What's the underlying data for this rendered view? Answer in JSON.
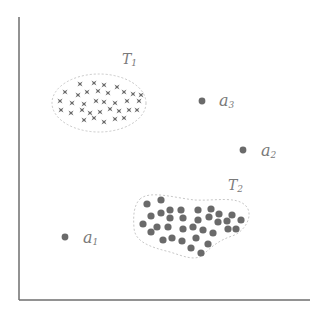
{
  "diagram": {
    "axes": {
      "color": "#6e6e6e",
      "x_axis": {
        "x1": 19,
        "x2": 310,
        "y": 300
      },
      "y_axis": {
        "x": 19,
        "y1": 17,
        "y2": 300
      }
    },
    "colors": {
      "marker": "#6a6a6a",
      "outline": "#c8c8c8",
      "label": "#7a7a7a"
    },
    "clusters": [
      {
        "id": "T1",
        "label_main": "T",
        "label_sub": "1",
        "marker": "star",
        "label_pos": [
          122,
          64
        ],
        "outline": {
          "cx": 99,
          "cy": 103,
          "rx": 47,
          "ry": 29
        },
        "points": [
          [
            80,
            84
          ],
          [
            94,
            83
          ],
          [
            104,
            85
          ],
          [
            117,
            87
          ],
          [
            65,
            92
          ],
          [
            78,
            95
          ],
          [
            87,
            92
          ],
          [
            98,
            91
          ],
          [
            108,
            93
          ],
          [
            124,
            92
          ],
          [
            133,
            94
          ],
          [
            141,
            95
          ],
          [
            60,
            101
          ],
          [
            72,
            103
          ],
          [
            84,
            104
          ],
          [
            96,
            101
          ],
          [
            104,
            102
          ],
          [
            115,
            103
          ],
          [
            127,
            101
          ],
          [
            139,
            101
          ],
          [
            61,
            110
          ],
          [
            71,
            113
          ],
          [
            82,
            110
          ],
          [
            90,
            113
          ],
          [
            100,
            112
          ],
          [
            110,
            109
          ],
          [
            119,
            111
          ],
          [
            129,
            110
          ],
          [
            137,
            110
          ],
          [
            84,
            120
          ],
          [
            94,
            118
          ],
          [
            104,
            122
          ],
          [
            115,
            119
          ],
          [
            124,
            118
          ]
        ]
      },
      {
        "id": "T2",
        "label_main": "T",
        "label_sub": "2",
        "marker": "dot",
        "label_pos": [
          228,
          190
        ],
        "outline_path": "M140,199 C150,190 175,198 195,200 C215,201 235,196 245,205 C255,214 245,232 232,236 C220,240 212,246 204,254 C196,262 183,256 170,252 C150,247 135,242 134,228 C133,215 134,205 140,199 Z",
        "points": [
          [
            147,
            204
          ],
          [
            161,
            200
          ],
          [
            151,
            216
          ],
          [
            161,
            213
          ],
          [
            170,
            210
          ],
          [
            181,
            210
          ],
          [
            170,
            218
          ],
          [
            183,
            218
          ],
          [
            143,
            224
          ],
          [
            157,
            227
          ],
          [
            168,
            227
          ],
          [
            151,
            232
          ],
          [
            183,
            229
          ],
          [
            193,
            227
          ],
          [
            198,
            210
          ],
          [
            198,
            220
          ],
          [
            211,
            209
          ],
          [
            209,
            217
          ],
          [
            219,
            214
          ],
          [
            227,
            221
          ],
          [
            232,
            215
          ],
          [
            241,
            220
          ],
          [
            218,
            222
          ],
          [
            203,
            230
          ],
          [
            213,
            233
          ],
          [
            228,
            229
          ],
          [
            236,
            229
          ],
          [
            163,
            240
          ],
          [
            172,
            238
          ],
          [
            182,
            241
          ],
          [
            196,
            238
          ],
          [
            191,
            248
          ],
          [
            201,
            253
          ],
          [
            208,
            244
          ]
        ]
      }
    ],
    "points": [
      {
        "id": "a3",
        "label_main": "a",
        "label_sub": "3",
        "x": 202,
        "y": 101,
        "label_x": 219,
        "label_y": 106
      },
      {
        "id": "a2",
        "label_main": "a",
        "label_sub": "2",
        "x": 243,
        "y": 150,
        "label_x": 261,
        "label_y": 156
      },
      {
        "id": "a1",
        "label_main": "a",
        "label_sub": "1",
        "x": 65,
        "y": 237,
        "label_x": 83,
        "label_y": 243
      }
    ]
  }
}
